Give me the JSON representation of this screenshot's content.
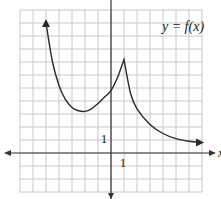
{
  "chart_data": {
    "type": "line",
    "title": "y = f(x)",
    "xlabel": "x",
    "ylabel": "",
    "tick_labels": {
      "x": "1",
      "y": "1"
    },
    "grid": true,
    "grid_spacing": 1,
    "xlim": [
      -7,
      7
    ],
    "ylim": [
      -3,
      11
    ],
    "legend": "none",
    "series": [
      {
        "name": "f(x)",
        "points": [
          {
            "x": -5.0,
            "y": 10.0
          },
          {
            "x": -4.5,
            "y": 7.0
          },
          {
            "x": -4.0,
            "y": 5.2
          },
          {
            "x": -3.5,
            "y": 4.1
          },
          {
            "x": -3.0,
            "y": 3.5
          },
          {
            "x": -2.5,
            "y": 3.25
          },
          {
            "x": -2.0,
            "y": 3.2
          },
          {
            "x": -1.5,
            "y": 3.4
          },
          {
            "x": -1.0,
            "y": 3.8
          },
          {
            "x": -0.5,
            "y": 4.3
          },
          {
            "x": 0.0,
            "y": 4.8
          },
          {
            "x": 0.5,
            "y": 5.8
          },
          {
            "x": 1.0,
            "y": 7.2
          },
          {
            "x": 1.5,
            "y": 4.6
          },
          {
            "x": 2.0,
            "y": 3.4
          },
          {
            "x": 3.0,
            "y": 2.2
          },
          {
            "x": 4.0,
            "y": 1.5
          },
          {
            "x": 5.0,
            "y": 1.1
          },
          {
            "x": 6.0,
            "y": 0.9
          },
          {
            "x": 7.0,
            "y": 0.8
          }
        ],
        "features": {
          "local_minimum": {
            "x": -2,
            "y": 3.2
          },
          "cusp_maximum": {
            "x": 1,
            "y": 7.2
          },
          "y_intercept": 4.8,
          "left_end": "arrow upward (y→∞ as x decreases)",
          "right_end": "arrow rightward approaching y≈0.5"
        }
      }
    ]
  },
  "labels": {
    "function": "y = f(x)",
    "x_axis": "x",
    "x_tick": "1",
    "y_tick": "1"
  },
  "colors": {
    "grid": "#c8c8c8",
    "axis": "#333333",
    "curve": "#2a2a2a"
  }
}
